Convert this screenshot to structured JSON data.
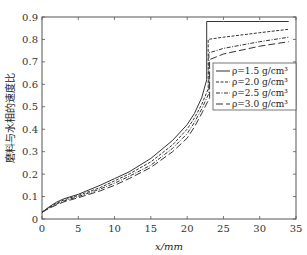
{
  "chart_data": {
    "type": "line",
    "title": "",
    "xlabel": "x/mm",
    "ylabel": "磨料与水相的速度比",
    "xlim": [
      0,
      35
    ],
    "ylim": [
      0,
      0.9
    ],
    "xticks": [
      0,
      5,
      10,
      15,
      20,
      25,
      30,
      35
    ],
    "yticks": [
      0,
      0.1,
      0.2,
      0.3,
      0.4,
      0.5,
      0.6,
      0.7,
      0.8,
      0.9
    ],
    "ytick_labels": [
      "0",
      "0.1",
      "0.2",
      "0.3",
      "0.4",
      "0.5",
      "0.6",
      "0.7",
      "0.8",
      "0.9"
    ],
    "grid": false,
    "legend_position": "right-center",
    "series": [
      {
        "name": "ρ=1.5 g/cm³",
        "style": "solid",
        "x": [
          0,
          1,
          2,
          3,
          5,
          8,
          10,
          12,
          15,
          18,
          20,
          21,
          22,
          22.7,
          22.7,
          25,
          30,
          34
        ],
        "y": [
          0.03,
          0.055,
          0.075,
          0.09,
          0.11,
          0.15,
          0.18,
          0.21,
          0.27,
          0.35,
          0.42,
          0.47,
          0.54,
          0.62,
          0.88,
          0.88,
          0.88,
          0.88
        ]
      },
      {
        "name": "ρ=2.0 g/cm³",
        "style": "dashed",
        "x": [
          0,
          1,
          2,
          3,
          5,
          8,
          10,
          12,
          15,
          18,
          20,
          21,
          22,
          22.9,
          22.9,
          25,
          30,
          34
        ],
        "y": [
          0.03,
          0.052,
          0.07,
          0.085,
          0.105,
          0.14,
          0.17,
          0.2,
          0.255,
          0.33,
          0.4,
          0.45,
          0.51,
          0.58,
          0.8,
          0.81,
          0.83,
          0.845
        ]
      },
      {
        "name": "ρ=2.5 g/cm³",
        "style": "dashdot",
        "x": [
          0,
          1,
          2,
          3,
          5,
          8,
          10,
          12,
          15,
          18,
          20,
          21,
          22,
          23.0,
          23.0,
          25,
          30,
          34
        ],
        "y": [
          0.03,
          0.05,
          0.067,
          0.08,
          0.1,
          0.133,
          0.16,
          0.19,
          0.24,
          0.315,
          0.38,
          0.43,
          0.49,
          0.56,
          0.74,
          0.76,
          0.79,
          0.81
        ]
      },
      {
        "name": "ρ=3.0 g/cm³",
        "style": "longdash",
        "x": [
          0,
          1,
          2,
          3,
          5,
          8,
          10,
          12,
          15,
          18,
          20,
          21,
          22,
          23.1,
          23.1,
          25,
          30,
          34
        ],
        "y": [
          0.03,
          0.048,
          0.063,
          0.076,
          0.095,
          0.125,
          0.15,
          0.18,
          0.23,
          0.3,
          0.36,
          0.41,
          0.47,
          0.54,
          0.71,
          0.735,
          0.77,
          0.79
        ]
      }
    ]
  }
}
